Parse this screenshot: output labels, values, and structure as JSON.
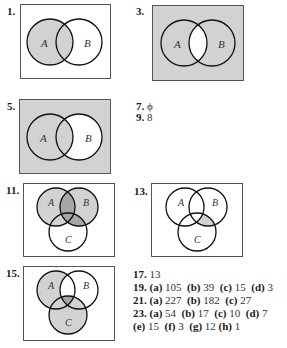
{
  "colors": {
    "light_shade": "#d2d2d2",
    "dark_shade": "#a6a6a6",
    "stroke": "#111111",
    "frame": "#555555"
  },
  "problems": [
    {
      "number": "1.",
      "type": "venn2",
      "labels": [
        "A",
        "B"
      ],
      "shaded": "A"
    },
    {
      "number": "3.",
      "type": "venn2",
      "labels": [
        "A",
        "B"
      ],
      "shaded": "complement of A∩B"
    },
    {
      "number": "5.",
      "type": "venn2",
      "labels": [
        "A",
        "B"
      ],
      "shaded": "complement of B−A"
    },
    {
      "number": "11.",
      "type": "venn3",
      "labels": [
        "A",
        "B",
        "C"
      ],
      "shaded": "A∪B light; A∩B and B∩C dark"
    },
    {
      "number": "13.",
      "type": "venn3",
      "labels": [
        "A",
        "B",
        "C"
      ],
      "shaded": "B∩C−A"
    },
    {
      "number": "15.",
      "type": "venn3",
      "labels": [
        "A",
        "B",
        "C"
      ],
      "shaded": "A∪C light except A∩B−C; A∩B∩C dark"
    }
  ],
  "answers": {
    "a7": {
      "number": "7.",
      "value": "ϕ"
    },
    "a9": {
      "number": "9.",
      "value": "8"
    },
    "a17": {
      "number": "17.",
      "value": "13"
    },
    "a19": {
      "number": "19.",
      "parts": [
        {
          "part": "(a)",
          "value": "105"
        },
        {
          "part": "(b)",
          "value": "39"
        },
        {
          "part": "(c)",
          "value": "15"
        },
        {
          "part": "(d)",
          "value": "3"
        }
      ]
    },
    "a21": {
      "number": "21.",
      "parts": [
        {
          "part": "(a)",
          "value": "227"
        },
        {
          "part": "(b)",
          "value": "182"
        },
        {
          "part": "(c)",
          "value": "27"
        }
      ]
    },
    "a23": {
      "number": "23.",
      "parts": [
        {
          "part": "(a)",
          "value": "54"
        },
        {
          "part": "(b)",
          "value": "17"
        },
        {
          "part": "(c)",
          "value": "10"
        },
        {
          "part": "(d)",
          "value": "7"
        },
        {
          "part": "(e)",
          "value": "15"
        },
        {
          "part": "(f)",
          "value": "3"
        },
        {
          "part": "(g)",
          "value": "12"
        },
        {
          "part": "(h)",
          "value": "1"
        }
      ]
    }
  }
}
